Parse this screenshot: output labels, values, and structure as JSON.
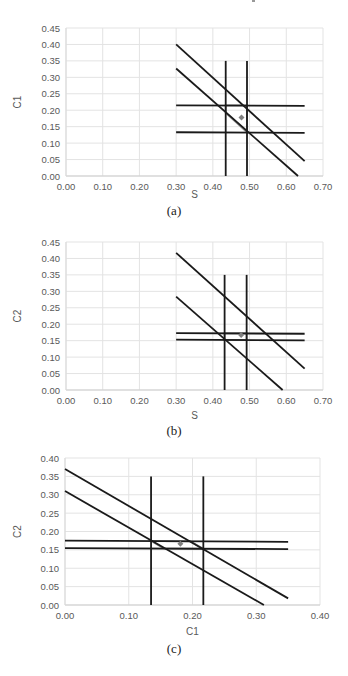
{
  "figure": {
    "captions": [
      "(a)",
      "(b)",
      "(c)"
    ]
  },
  "chart_data": [
    {
      "type": "line",
      "id": "a",
      "title": "",
      "caption": "(a)",
      "xlabel": "S",
      "ylabel": "C1",
      "xlim": [
        0.0,
        0.7
      ],
      "ylim": [
        0.0,
        0.45
      ],
      "xticks": [
        "0.00",
        "0.10",
        "0.20",
        "0.30",
        "0.40",
        "0.50",
        "0.60",
        "0.70"
      ],
      "yticks": [
        "0.00",
        "0.05",
        "0.10",
        "0.15",
        "0.20",
        "0.25",
        "0.30",
        "0.35",
        "0.40",
        "0.45"
      ],
      "grid": true,
      "legend": null,
      "series": [
        {
          "name": "vertical-1",
          "color": "#1a1a1a",
          "points": [
            [
              0.435,
              0.0
            ],
            [
              0.435,
              0.35
            ]
          ]
        },
        {
          "name": "vertical-2",
          "color": "#1a1a1a",
          "points": [
            [
              0.493,
              0.0
            ],
            [
              0.493,
              0.35
            ]
          ]
        },
        {
          "name": "horizontal-upper",
          "color": "#1a1a1a",
          "points": [
            [
              0.3,
              0.215
            ],
            [
              0.65,
              0.213
            ]
          ]
        },
        {
          "name": "horizontal-lower",
          "color": "#1a1a1a",
          "points": [
            [
              0.3,
              0.133
            ],
            [
              0.65,
              0.131
            ]
          ]
        },
        {
          "name": "diagonal-upper",
          "color": "#1a1a1a",
          "points": [
            [
              0.3,
              0.4
            ],
            [
              0.65,
              0.045
            ]
          ]
        },
        {
          "name": "diagonal-lower",
          "color": "#1a1a1a",
          "points": [
            [
              0.3,
              0.327
            ],
            [
              0.632,
              0.0
            ]
          ]
        },
        {
          "name": "feasible-region",
          "color": "#8c8c8c",
          "closed": true,
          "points": [
            [
              0.435,
              0.215
            ],
            [
              0.493,
              0.215
            ],
            [
              0.493,
              0.133
            ],
            [
              0.435,
              0.192
            ]
          ]
        }
      ],
      "markers": [
        {
          "name": "estimate",
          "x": 0.478,
          "y": 0.178,
          "color": "#7f7f7f"
        }
      ]
    },
    {
      "type": "line",
      "id": "b",
      "title": "",
      "caption": "(b)",
      "xlabel": "S",
      "ylabel": "C2",
      "xlim": [
        0.0,
        0.7
      ],
      "ylim": [
        0.0,
        0.45
      ],
      "xticks": [
        "0.00",
        "0.10",
        "0.20",
        "0.30",
        "0.40",
        "0.50",
        "0.60",
        "0.70"
      ],
      "yticks": [
        "0.00",
        "0.05",
        "0.10",
        "0.15",
        "0.20",
        "0.25",
        "0.30",
        "0.35",
        "0.40",
        "0.45"
      ],
      "grid": true,
      "legend": null,
      "series": [
        {
          "name": "vertical-1",
          "color": "#1a1a1a",
          "points": [
            [
              0.432,
              0.0
            ],
            [
              0.432,
              0.35
            ]
          ]
        },
        {
          "name": "vertical-2",
          "color": "#1a1a1a",
          "points": [
            [
              0.492,
              0.0
            ],
            [
              0.492,
              0.35
            ]
          ]
        },
        {
          "name": "horizontal-upper",
          "color": "#1a1a1a",
          "points": [
            [
              0.3,
              0.173
            ],
            [
              0.65,
              0.171
            ]
          ]
        },
        {
          "name": "horizontal-lower",
          "color": "#1a1a1a",
          "points": [
            [
              0.3,
              0.153
            ],
            [
              0.65,
              0.151
            ]
          ]
        },
        {
          "name": "diagonal-upper",
          "color": "#1a1a1a",
          "points": [
            [
              0.3,
              0.417
            ],
            [
              0.65,
              0.065
            ]
          ]
        },
        {
          "name": "diagonal-lower",
          "color": "#1a1a1a",
          "points": [
            [
              0.3,
              0.284
            ],
            [
              0.59,
              0.0
            ]
          ]
        },
        {
          "name": "feasible-region",
          "color": "#8c8c8c",
          "closed": true,
          "points": [
            [
              0.432,
              0.172
            ],
            [
              0.492,
              0.172
            ],
            [
              0.492,
              0.152
            ],
            [
              0.432,
              0.152
            ]
          ]
        }
      ],
      "markers": [
        {
          "name": "estimate",
          "x": 0.477,
          "y": 0.167,
          "color": "#7f7f7f"
        }
      ]
    },
    {
      "type": "line",
      "id": "c",
      "title": "",
      "caption": "(c)",
      "xlabel": "C1",
      "ylabel": "C2",
      "xlim": [
        0.0,
        0.4
      ],
      "ylim": [
        0.0,
        0.4
      ],
      "xticks": [
        "0.00",
        "0.10",
        "0.20",
        "0.30",
        "0.40"
      ],
      "yticks": [
        "0.00",
        "0.05",
        "0.10",
        "0.15",
        "0.20",
        "0.25",
        "0.30",
        "0.35",
        "0.40"
      ],
      "grid": true,
      "legend": null,
      "series": [
        {
          "name": "vertical-1",
          "color": "#1a1a1a",
          "points": [
            [
              0.135,
              0.0
            ],
            [
              0.135,
              0.35
            ]
          ]
        },
        {
          "name": "vertical-2",
          "color": "#1a1a1a",
          "points": [
            [
              0.217,
              0.0
            ],
            [
              0.217,
              0.35
            ]
          ]
        },
        {
          "name": "horizontal-upper",
          "color": "#1a1a1a",
          "points": [
            [
              0.0,
              0.175
            ],
            [
              0.35,
              0.172
            ]
          ]
        },
        {
          "name": "horizontal-lower",
          "color": "#1a1a1a",
          "points": [
            [
              0.0,
              0.155
            ],
            [
              0.35,
              0.152
            ]
          ]
        },
        {
          "name": "diagonal-upper",
          "color": "#1a1a1a",
          "points": [
            [
              0.0,
              0.37
            ],
            [
              0.35,
              0.018
            ]
          ]
        },
        {
          "name": "diagonal-lower",
          "color": "#1a1a1a",
          "points": [
            [
              0.0,
              0.31
            ],
            [
              0.312,
              0.0
            ]
          ]
        },
        {
          "name": "feasible-region",
          "color": "#8c8c8c",
          "closed": true,
          "points": [
            [
              0.135,
              0.174
            ],
            [
              0.197,
              0.173
            ],
            [
              0.217,
              0.153
            ],
            [
              0.155,
              0.154
            ]
          ]
        }
      ],
      "markers": [
        {
          "name": "estimate",
          "x": 0.181,
          "y": 0.167,
          "color": "#7f7f7f"
        }
      ]
    }
  ],
  "layout": [
    {
      "top": 0,
      "height": 225,
      "plot": {
        "left": 66,
        "right": 323,
        "top": 28,
        "bottom": 176
      },
      "xlabel_y": 198,
      "caption_top": 205
    },
    {
      "top": 0,
      "height": 445,
      "plot": {
        "left": 66,
        "right": 323,
        "top": 242,
        "bottom": 390
      },
      "xlabel_y": 419,
      "caption_top": 425
    },
    {
      "top": 0,
      "height": 676,
      "plot": {
        "left": 65,
        "right": 320,
        "top": 458,
        "bottom": 605
      },
      "xlabel_y": 635,
      "caption_top": 642
    }
  ]
}
